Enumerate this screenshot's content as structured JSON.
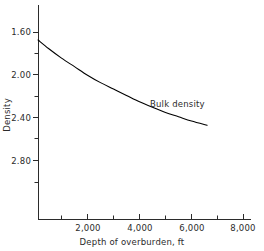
{
  "chart_data": {
    "type": "line",
    "title": "",
    "xlabel": "Depth of overburden, ft",
    "ylabel": "Density",
    "xlim": [
      0,
      8000
    ],
    "ylim": [
      2.95,
      1.45
    ],
    "y_axis_inverted": true,
    "grid": false,
    "legend": "none",
    "x_major_ticks": [
      2000,
      4000,
      6000,
      8000
    ],
    "x_major_tick_labels": [
      "2,000",
      "4,000",
      "6,000",
      "8,000"
    ],
    "x_minor_ticks": [
      1000,
      3000,
      5000,
      7000
    ],
    "y_major_ticks": [
      1.6,
      2.0,
      2.4,
      2.8
    ],
    "y_major_tick_labels": [
      "1.60",
      "2.00",
      "2.40",
      "2.80"
    ],
    "y_minor_ticks": [
      1.8,
      2.2,
      2.6
    ],
    "series": [
      {
        "name": "Bulk density",
        "annotation": "Bulk density",
        "annotation_x": 4600,
        "annotation_y": 2.22,
        "color": "#000000",
        "x": [
          100,
          500,
          1000,
          1500,
          2000,
          2500,
          3000,
          3500,
          4000,
          4500,
          5000,
          5500,
          6000,
          6600
        ],
        "y": [
          1.67,
          1.75,
          1.84,
          1.92,
          2.0,
          2.07,
          2.13,
          2.19,
          2.25,
          2.3,
          2.35,
          2.39,
          2.43,
          2.47
        ]
      }
    ]
  },
  "axes": {
    "x_title": "Depth of overburden, ft",
    "y_title": "Density",
    "x_tick_labels": [
      "2,000",
      "4,000",
      "6,000",
      "8,000"
    ],
    "y_tick_labels": [
      "1.60",
      "2.00",
      "2.40",
      "2.80"
    ]
  },
  "annotations": {
    "bulk_density": "Bulk density"
  },
  "colors": {
    "background": "#ffffff",
    "axis": "#2b2b2b",
    "curve": "#000000",
    "text": "#2b2b2b"
  }
}
